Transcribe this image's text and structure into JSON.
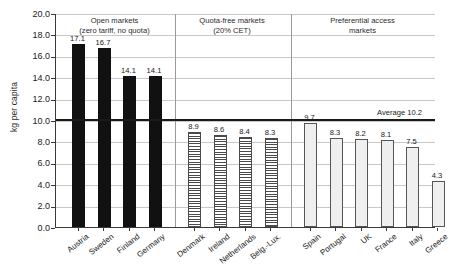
{
  "chart_data": {
    "type": "bar",
    "title": "",
    "subtitle": "",
    "xlabel": "",
    "ylabel": "kg per capita",
    "ylim": [
      0.0,
      20.0
    ],
    "ytick_step": 2.0,
    "ytick_labels": [
      "20.0",
      "18.0",
      "16.0",
      "14.0",
      "12.0",
      "10.0",
      "8.0",
      "6.0",
      "4.0",
      "2.0",
      "0.0"
    ],
    "ytick_values": [
      20.0,
      18.0,
      16.0,
      14.0,
      12.0,
      10.0,
      8.0,
      6.0,
      4.0,
      2.0,
      0.0
    ],
    "grid": true,
    "legend": "none",
    "categories": [
      "Austria",
      "Sweden",
      "Finland",
      "Germany",
      "Denmark",
      "Ireland",
      "Netherlands",
      "Belg.-Lux.",
      "Spain",
      "Portugal",
      "UK",
      "France",
      "Italy",
      "Greece"
    ],
    "values": [
      17.1,
      16.7,
      14.1,
      14.1,
      8.9,
      8.6,
      8.4,
      8.3,
      9.7,
      8.3,
      8.2,
      8.1,
      7.5,
      4.3
    ],
    "value_labels": [
      "17.1",
      "16.7",
      "14.1",
      "14.1",
      "8.9",
      "8.6",
      "8.4",
      "8.3",
      "9.7",
      "8.3",
      "8.2",
      "8.1",
      "7.5",
      "4.3"
    ],
    "groups": [
      {
        "header": "Open markets\n(zero tariff, no quota)",
        "header_line1": "Open markets",
        "header_line2": "(zero tariff, no quota)",
        "style": "solid",
        "fill": "#111111",
        "categories": [
          "Austria",
          "Sweden",
          "Finland",
          "Germany"
        ],
        "values": [
          17.1,
          16.7,
          14.1,
          14.1
        ]
      },
      {
        "header": "Quota-free markets\n(20% CET)",
        "header_line1": "Quota-free markets",
        "header_line2": "(20% CET)",
        "style": "hatch",
        "fill": "#4a4a4a",
        "categories": [
          "Denmark",
          "Ireland",
          "Netherlands",
          "Belg.-Lux."
        ],
        "values": [
          8.9,
          8.6,
          8.4,
          8.3
        ]
      },
      {
        "header": "Preferential access\nmarkets",
        "header_line1": "Preferential access",
        "header_line2": "markets",
        "style": "light",
        "fill": "#efefef",
        "categories": [
          "Spain",
          "Portugal",
          "UK",
          "France",
          "Italy",
          "Greece"
        ],
        "values": [
          9.7,
          8.3,
          8.2,
          8.1,
          7.5,
          4.3
        ]
      }
    ],
    "annotations": [
      {
        "name": "average-line",
        "label": "Average 10.2",
        "value": 10.2
      }
    ]
  }
}
